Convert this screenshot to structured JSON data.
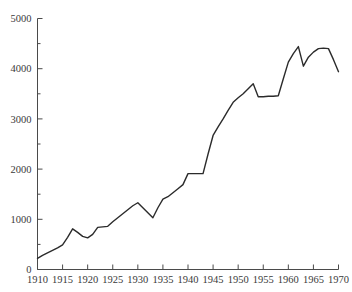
{
  "chart_data": {
    "type": "line",
    "title": "",
    "subtitle": "",
    "xlabel": "",
    "ylabel": "",
    "xlim": [
      1910,
      1970
    ],
    "ylim": [
      0,
      5000
    ],
    "grid": false,
    "legend": null,
    "annotations": [],
    "series": [
      {
        "name": "series-1",
        "color": "#2b2b2b",
        "x": [
          1910,
          1911,
          1912,
          1913,
          1914,
          1915,
          1916,
          1917,
          1918,
          1919,
          1920,
          1921,
          1922,
          1923,
          1924,
          1925,
          1926,
          1927,
          1928,
          1929,
          1930,
          1931,
          1932,
          1933,
          1934,
          1935,
          1936,
          1937,
          1938,
          1939,
          1940,
          1941,
          1942,
          1943,
          1944,
          1945,
          1946,
          1947,
          1948,
          1949,
          1950,
          1951,
          1952,
          1953,
          1954,
          1955,
          1956,
          1957,
          1958,
          1959,
          1960,
          1961,
          1962,
          1963,
          1964,
          1965,
          1966,
          1967,
          1968,
          1969,
          1970
        ],
        "y": [
          220,
          280,
          330,
          380,
          430,
          490,
          640,
          810,
          740,
          660,
          630,
          700,
          840,
          850,
          860,
          950,
          1030,
          1110,
          1190,
          1270,
          1330,
          1230,
          1130,
          1030,
          1230,
          1400,
          1450,
          1530,
          1610,
          1690,
          1910,
          1910,
          1910,
          1910,
          2300,
          2670,
          2840,
          3000,
          3170,
          3330,
          3420,
          3500,
          3600,
          3700,
          3440,
          3440,
          3450,
          3450,
          3460,
          3800,
          4130,
          4300,
          4440,
          4050,
          4230,
          4330,
          4400,
          4410,
          4400,
          4180,
          3940
        ]
      }
    ],
    "x_ticks": {
      "major_values": [
        1910,
        1915,
        1920,
        1925,
        1930,
        1935,
        1940,
        1945,
        1950,
        1955,
        1960,
        1965,
        1970
      ],
      "major_labels": [
        "1910",
        "1915",
        "1920",
        "1925",
        "1930",
        "1935",
        "1940",
        "1945",
        "1950",
        "1955",
        "1960",
        "1965",
        "1970"
      ]
    },
    "y_ticks": {
      "major_values": [
        0,
        1000,
        2000,
        3000,
        4000,
        5000
      ],
      "major_labels": [
        "0",
        "1000",
        "2000",
        "3000",
        "4000",
        "5000"
      ],
      "minor_values": [
        500,
        1500,
        2500,
        3500,
        4500
      ]
    },
    "colors": {
      "line": "#2b2b2b",
      "axis": "#4a4a4a",
      "text": "#3a3a3a",
      "background": "#ffffff"
    }
  }
}
